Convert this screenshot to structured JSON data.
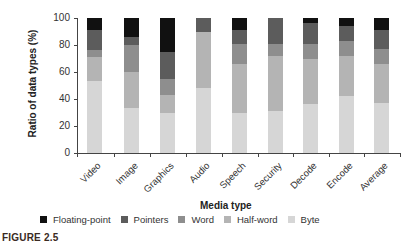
{
  "chart_data": {
    "type": "bar",
    "stacked": true,
    "title": "",
    "xlabel": "Media type",
    "ylabel": "Ratio of data types (%)",
    "ylim": [
      0,
      100
    ],
    "yticks": [
      0,
      20,
      40,
      60,
      80,
      100
    ],
    "grid": false,
    "legend_position": "bottom",
    "categories": [
      "Video",
      "Image",
      "Graphics",
      "Audio",
      "Speech",
      "Security",
      "Decode",
      "Encode",
      "Average"
    ],
    "series": [
      {
        "name": "Byte",
        "color": "#d6d6d6",
        "values": [
          53,
          33,
          30,
          48,
          30,
          31,
          36,
          42,
          37
        ]
      },
      {
        "name": "Half-word",
        "color": "#b4b4b4",
        "values": [
          18,
          27,
          13,
          42,
          36,
          41,
          34,
          30,
          29
        ]
      },
      {
        "name": "Word",
        "color": "#8e8e8e",
        "values": [
          5,
          20,
          12,
          0,
          15,
          9,
          11,
          11,
          11
        ]
      },
      {
        "name": "Pointers",
        "color": "#5c5c5c",
        "values": [
          15,
          6,
          20,
          10,
          10,
          19,
          15,
          11,
          14
        ]
      },
      {
        "name": "Floating-point",
        "color": "#111111",
        "values": [
          9,
          14,
          25,
          0,
          9,
          0,
          4,
          6,
          9
        ]
      }
    ]
  },
  "legend": [
    {
      "label": "Floating-point",
      "color": "#111111"
    },
    {
      "label": "Pointers",
      "color": "#5c5c5c"
    },
    {
      "label": "Word",
      "color": "#8e8e8e"
    },
    {
      "label": "Half-word",
      "color": "#b4b4b4"
    },
    {
      "label": "Byte",
      "color": "#d6d6d6"
    }
  ],
  "figure_label": "FIGURE 2.5"
}
